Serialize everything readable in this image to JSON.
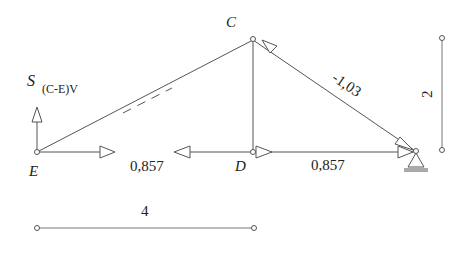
{
  "diagram": {
    "type": "truss-force-diagram",
    "nodes": {
      "E": {
        "label": "E"
      },
      "C": {
        "label": "C"
      },
      "D": {
        "label": "D"
      }
    },
    "labels": {
      "force_symbol": "S",
      "force_subscript": "(C-E)V",
      "ce_force": "",
      "cb_force": "-1,03",
      "ed_force": "0,857",
      "db_force": "0,857",
      "height_dim": "2",
      "width_dim": "4"
    },
    "colors": {
      "line": "#555555",
      "text": "#222222",
      "background": "#ffffff"
    }
  }
}
